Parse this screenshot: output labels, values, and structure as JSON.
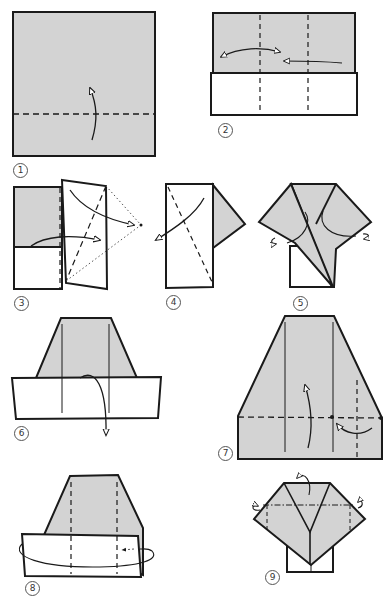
{
  "diagram": {
    "type": "origami-instructions",
    "colors": {
      "paper_colored": "#d3d3d3",
      "paper_white": "#ffffff",
      "line": "#1a1a1a"
    },
    "steps": [
      {
        "number": "1",
        "description": "Square, colored side up; valley fold bottom edge up along dashed line"
      },
      {
        "number": "2",
        "description": "Two vertical dashed fold lines; arrows fold sides to center"
      },
      {
        "number": "3",
        "description": "Fold right flap out; diagonal dashed line with dotted triangle guide"
      },
      {
        "number": "4",
        "description": "Fold along diagonal dashed line, arrow to left"
      },
      {
        "number": "5",
        "description": "Flaps folded into triangles; curved arrows on both sides"
      },
      {
        "number": "6",
        "description": "Trapezoid shape; fold bottom band down"
      },
      {
        "number": "7",
        "description": "Enlarged trapezoid; dashed horizontal fold line with arrows"
      },
      {
        "number": "8",
        "description": "Fold band; looped arrow around back"
      },
      {
        "number": "9",
        "description": "Final shirt/kimono shape with dash-dot fold line"
      }
    ]
  }
}
